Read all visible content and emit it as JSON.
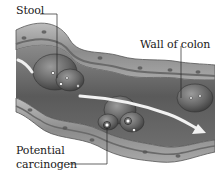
{
  "figure": {
    "type": "anatomical-illustration"
  },
  "labels": {
    "stool": "Stool",
    "wall_of_colon": "Wall of colon",
    "potential_line1": "Potential",
    "potential_line2": "carcinogen"
  },
  "colors": {
    "background": "#ffffff",
    "wall_outer": "#9a9a9a",
    "wall_inner": "#7d7d7d",
    "lumen": "#5e5e5e",
    "stool": "#6b6b6b",
    "arrow": "#f2f2f2",
    "text": "#1a1a1a"
  }
}
